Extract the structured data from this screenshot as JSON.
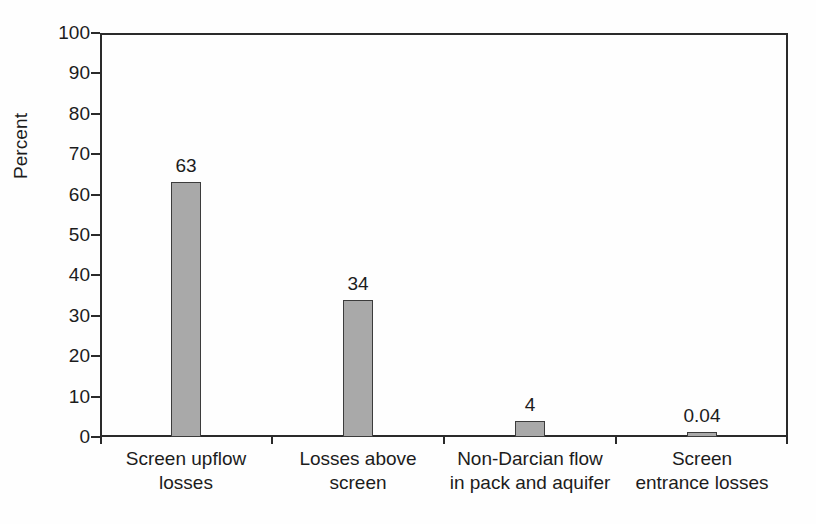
{
  "chart_data": {
    "type": "bar",
    "title": "",
    "xlabel": "",
    "ylabel": "Percent",
    "ylim": [
      0,
      100
    ],
    "ytick_step": 10,
    "grid": false,
    "legend": "none",
    "bar_color": "#a9a9a9",
    "bar_edge_color": "#3c3c3c",
    "axis_color": "#2a2a2a",
    "categories": [
      "Screen upflow losses",
      "Losses above screen",
      "Non-Darcian flow in pack and aquifer",
      "Screen entrance losses"
    ],
    "category_lines": [
      [
        "Screen upflow",
        "losses"
      ],
      [
        "Losses above",
        "screen"
      ],
      [
        "Non-Darcian flow",
        "in pack and aquifer"
      ],
      [
        "Screen",
        "entrance losses"
      ]
    ],
    "values": [
      63,
      34,
      4,
      0.04
    ],
    "value_labels": [
      "63",
      "34",
      "4",
      "0.04"
    ],
    "ytick_labels": [
      "100",
      "90",
      "80",
      "70",
      "60",
      "50",
      "40",
      "30",
      "20",
      "10",
      "0"
    ],
    "ytick_values": [
      100,
      90,
      80,
      70,
      60,
      50,
      40,
      30,
      20,
      10,
      0
    ]
  }
}
